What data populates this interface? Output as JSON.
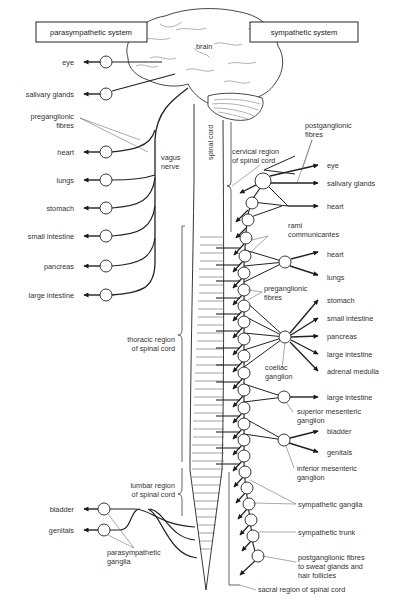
{
  "title_boxes": {
    "parasympathetic": "parasympathetic system",
    "sympathetic": "sympathetic system"
  },
  "center_labels": {
    "brain": "brain",
    "spinal_cord": "spinal cord",
    "vagus_nerve_1": "vagus",
    "vagus_nerve_2": "nerve",
    "cervical_1": "cervical region",
    "cervical_2": "of spinal cord",
    "thoracic_1": "thoracic region",
    "thoracic_2": "of spinal cord",
    "lumbar_1": "lumbar region",
    "lumbar_2": "of spinal cord",
    "sacral": "sacral region of spinal cord"
  },
  "parasympathetic": {
    "targets": [
      "eye",
      "salivary glands",
      "heart",
      "lungs",
      "stomach",
      "small intestine",
      "pancreas",
      "large intestine"
    ],
    "preganglionic_1": "preganglionic",
    "preganglionic_2": "fibres",
    "sacral_targets": [
      "bladder",
      "genitals"
    ],
    "ganglia_1": "parasympathetic",
    "ganglia_2": "ganglia"
  },
  "sympathetic": {
    "postganglionic_1": "postganglionic",
    "postganglionic_2": "fibres",
    "cervical_targets": [
      "eye",
      "salivary glands",
      "heart"
    ],
    "rami_1": "rami",
    "rami_2": "communicantes",
    "thoracic_targets": [
      "heart",
      "lungs"
    ],
    "preganglionic_1": "preganglionic",
    "preganglionic_2": "fibres",
    "coeliac_targets": [
      "stomach",
      "small intestine",
      "pancreas",
      "large intestine",
      "adrenal medulla"
    ],
    "coeliac_1": "coeliac",
    "coeliac_2": "ganglion",
    "superior_target": "large intestine",
    "superior_1": "superior mesenteric",
    "superior_2": "ganglion",
    "inferior_targets": [
      "bladder",
      "genitals"
    ],
    "inferior_1": "inferior mesenteric",
    "inferior_2": "ganglion",
    "ganglia": "sympathetic ganglia",
    "trunk": "sympathetic trunk",
    "sweat_1": "postganglionic fibres",
    "sweat_2": "to sweat glands and",
    "sweat_3": "hair follicles"
  }
}
